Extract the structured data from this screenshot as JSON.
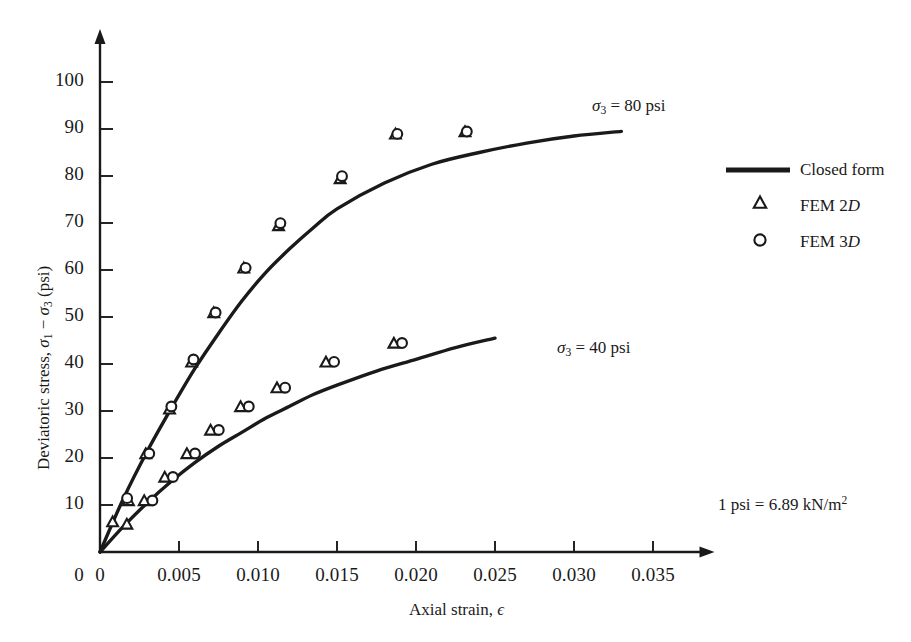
{
  "chart_data": {
    "type": "line",
    "title": "",
    "xlabel": "Axial strain, ε",
    "ylabel": "Deviatoric stress, σ₁ − σ₃ (psi)",
    "xlim": [
      0,
      0.0375
    ],
    "ylim": [
      0,
      107
    ],
    "grid": false,
    "xticks": [
      0,
      0.005,
      0.01,
      0.015,
      0.02,
      0.025,
      0.03,
      0.035
    ],
    "xticklabels": [
      "0",
      "0.005",
      "0.010",
      "0.015",
      "0.020",
      "0.025",
      "0.030",
      "0.035"
    ],
    "yticks": [
      10,
      20,
      30,
      40,
      50,
      60,
      70,
      80,
      90,
      100
    ],
    "yticklabels": [
      "10",
      "20",
      "30",
      "40",
      "50",
      "60",
      "70",
      "80",
      "90",
      "100"
    ],
    "legend_position": "right",
    "units_note": "1 psi = 6.89 kN/m²",
    "series": [
      {
        "name": "σ₃ = 80 psi closed form",
        "style": "line",
        "annotation": "σ₃ = 80 psi",
        "x": [
          0,
          0.0015,
          0.003,
          0.0045,
          0.006,
          0.0075,
          0.009,
          0.0105,
          0.012,
          0.0135,
          0.015,
          0.018,
          0.021,
          0.024,
          0.027,
          0.03,
          0.033
        ],
        "y": [
          0,
          11.5,
          21.5,
          30.5,
          39.0,
          46.5,
          53.5,
          59.5,
          64.5,
          69.0,
          73.0,
          78.5,
          82.5,
          85.0,
          87.0,
          88.5,
          89.5
        ]
      },
      {
        "name": "σ₃ = 40 psi closed form",
        "style": "line",
        "annotation": "σ₃ = 40 psi",
        "x": [
          0,
          0.0015,
          0.003,
          0.0045,
          0.006,
          0.0075,
          0.009,
          0.0105,
          0.012,
          0.0135,
          0.015,
          0.0175,
          0.02,
          0.0225,
          0.025
        ],
        "y": [
          0,
          5.5,
          10.5,
          15.0,
          19.0,
          22.5,
          25.5,
          28.5,
          31.0,
          33.5,
          35.5,
          38.5,
          41.0,
          43.5,
          45.5
        ]
      },
      {
        "name": "FEM 2D — σ₃ = 80 psi",
        "style": "triangle",
        "x": [
          0.0008,
          0.0018,
          0.0029,
          0.0044,
          0.0058,
          0.0072,
          0.0091,
          0.0113,
          0.0152,
          0.0187,
          0.0231
        ],
        "y": [
          5.5,
          10.0,
          20.0,
          29.5,
          39.5,
          50.0,
          59.5,
          68.5,
          78.5,
          88.0,
          88.5
        ]
      },
      {
        "name": "FEM 3D — σ₃ = 80 psi",
        "style": "circle",
        "x": [
          0.0014,
          0.0028,
          0.0042,
          0.0056,
          0.007,
          0.0089,
          0.0111,
          0.015,
          0.0185,
          0.0229
        ],
        "y": [
          10.5,
          20.0,
          30.0,
          40.0,
          50.0,
          59.5,
          69.0,
          79.0,
          88.0,
          88.5
        ]
      },
      {
        "name": "FEM 2D — σ₃ = 40 psi",
        "style": "triangle",
        "x": [
          0.0017,
          0.0028,
          0.0041,
          0.0055,
          0.007,
          0.0089,
          0.0112,
          0.0143,
          0.0186
        ],
        "y": [
          5.0,
          10.0,
          15.0,
          20.0,
          25.0,
          30.0,
          34.0,
          39.5,
          43.5
        ]
      },
      {
        "name": "FEM 3D — σ₃ = 40 psi",
        "style": "circle",
        "x": [
          0.003,
          0.0043,
          0.0057,
          0.0072,
          0.0091,
          0.0114,
          0.0145,
          0.0188
        ],
        "y": [
          10.0,
          15.0,
          20.0,
          25.0,
          30.0,
          34.0,
          39.5,
          43.5
        ]
      }
    ]
  },
  "axes": {
    "y_title_prefix": "Deviatoric stress, ",
    "y_title_sigma1": "σ",
    "y_title_sub1": "1",
    "y_title_minus": " − ",
    "y_title_sigma3": "σ",
    "y_title_sub3": "3",
    "y_title_suffix": " (psi)",
    "x_title_prefix": "Axial strain, ",
    "x_title_eps": "ϵ"
  },
  "annotations": {
    "upper": {
      "sigma": "σ",
      "sub": "3",
      "rest": " = 80 psi"
    },
    "lower": {
      "sigma": "σ",
      "sub": "3",
      "rest": " = 40 psi"
    }
  },
  "legend": {
    "items": [
      {
        "marker": "line-swatch",
        "label": "Closed form"
      },
      {
        "marker": "triangle-marker",
        "label_prefix": "FEM 2",
        "label_italic": "D"
      },
      {
        "marker": "circle-marker",
        "label_prefix": "FEM 3",
        "label_italic": "D"
      }
    ]
  },
  "footnote": {
    "lead": "1 psi = 6.89 kN/m",
    "exp": "2"
  },
  "colors": {
    "ink": "#1a1a1a",
    "background": "#ffffff"
  }
}
